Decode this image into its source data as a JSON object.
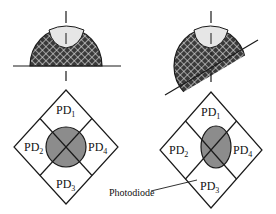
{
  "figure": {
    "colors": {
      "stroke": "#1a1a1a",
      "hatch_bg": "#3a3a3a",
      "hatch_line": "#d8d8d8",
      "cap_fill": "#e6e6e6",
      "spot_fill": "#8c8c8c"
    },
    "left": {
      "name": "flat-surface",
      "quadrants": [
        {
          "id": "pd1",
          "prefix": "PD",
          "sub": "1"
        },
        {
          "id": "pd2",
          "prefix": "PD",
          "sub": "2"
        },
        {
          "id": "pd3",
          "prefix": "PD",
          "sub": "3"
        },
        {
          "id": "pd4",
          "prefix": "PD",
          "sub": "4"
        }
      ]
    },
    "right": {
      "name": "tilted-surface",
      "quadrants": [
        {
          "id": "pd1",
          "prefix": "PD",
          "sub": "1"
        },
        {
          "id": "pd2",
          "prefix": "PD",
          "sub": "2"
        },
        {
          "id": "pd3",
          "prefix": "PD",
          "sub": "3"
        },
        {
          "id": "pd4",
          "prefix": "PD",
          "sub": "4"
        }
      ]
    },
    "callout": {
      "label": "Photodiode"
    }
  }
}
